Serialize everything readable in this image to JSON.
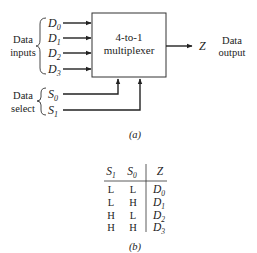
{
  "diagram": {
    "block_label_line1": "4-to-1",
    "block_label_line2": "multiplexer",
    "data_inputs_label_line1": "Data",
    "data_inputs_label_line2": "inputs",
    "data_select_label_line1": "Data",
    "data_select_label_line2": "select",
    "inputs": [
      {
        "name": "D",
        "sub": "0"
      },
      {
        "name": "D",
        "sub": "1"
      },
      {
        "name": "D",
        "sub": "2"
      },
      {
        "name": "D",
        "sub": "3"
      }
    ],
    "selects": [
      {
        "name": "S",
        "sub": "0"
      },
      {
        "name": "S",
        "sub": "1"
      }
    ],
    "output_name": "Z",
    "output_label_line1": "Data",
    "output_label_line2": "output",
    "caption": "(a)"
  },
  "truth_table": {
    "headers": [
      {
        "name": "S",
        "sub": "1"
      },
      {
        "name": "S",
        "sub": "0"
      },
      {
        "name": "Z",
        "sub": ""
      }
    ],
    "rows": [
      {
        "s1": "L",
        "s0": "L",
        "z": "D",
        "zsub": "0"
      },
      {
        "s1": "L",
        "s0": "H",
        "z": "D",
        "zsub": "1"
      },
      {
        "s1": "H",
        "s0": "L",
        "z": "D",
        "zsub": "2"
      },
      {
        "s1": "H",
        "s0": "H",
        "z": "D",
        "zsub": "3"
      }
    ],
    "caption": "(b)"
  }
}
